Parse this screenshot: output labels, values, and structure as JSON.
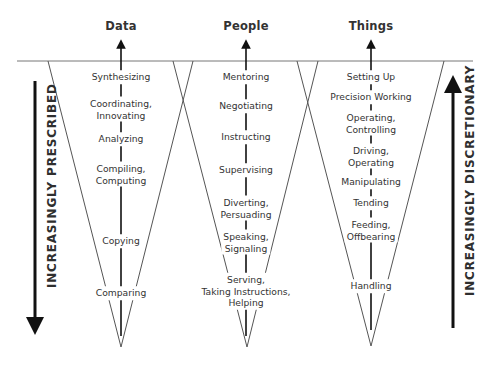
{
  "columns": [
    {
      "title": "Data",
      "center_x": 121,
      "items": [
        {
          "label": "Synthesizing",
          "y": 77
        },
        {
          "label": "Coordinating,\nInnovating",
          "y": 109
        },
        {
          "label": "Analyzing",
          "y": 139
        },
        {
          "label": "Compiling,\nComputing",
          "y": 174
        },
        {
          "label": "Copying",
          "y": 241
        },
        {
          "label": "Comparing",
          "y": 293
        }
      ]
    },
    {
      "title": "People",
      "center_x": 246,
      "items": [
        {
          "label": "Mentoring",
          "y": 77
        },
        {
          "label": "Negotiating",
          "y": 106
        },
        {
          "label": "Instructing",
          "y": 137
        },
        {
          "label": "Supervising",
          "y": 170
        },
        {
          "label": "Diverting,\nPersuading",
          "y": 208
        },
        {
          "label": "Speaking,\nSignaling",
          "y": 242
        },
        {
          "label": "Serving,\nTaking Instructions,\nHelping",
          "y": 291
        }
      ]
    },
    {
      "title": "Things",
      "center_x": 371,
      "items": [
        {
          "label": "Setting Up",
          "y": 77
        },
        {
          "label": "Precision Working",
          "y": 97
        },
        {
          "label": "Operating,\nControlling",
          "y": 123
        },
        {
          "label": "Driving,\nOperating",
          "y": 156
        },
        {
          "label": "Manipulating",
          "y": 182
        },
        {
          "label": "Tending",
          "y": 203
        },
        {
          "label": "Feeding,\nOffbearing",
          "y": 230
        },
        {
          "label": "Handling",
          "y": 286
        }
      ]
    }
  ],
  "side_labels": {
    "left": "INCREASINGLY PRESCRIBED",
    "right": "INCREASINGLY DISCRETIONARY"
  },
  "colors": {
    "line": "#555555",
    "arrow": "#111111",
    "text": "#333333"
  }
}
